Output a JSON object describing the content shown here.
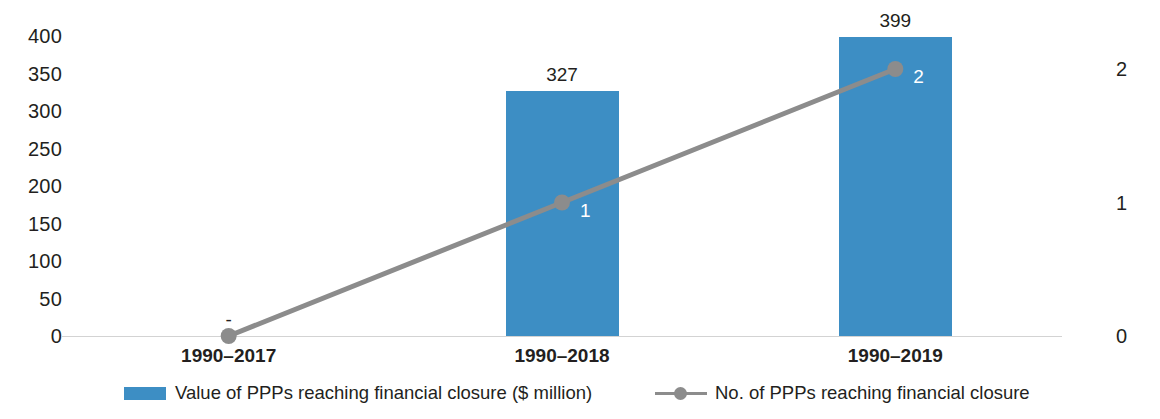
{
  "chart_data": {
    "type": "bar",
    "title": "",
    "subtitle": "",
    "xlabel": "",
    "ylabel": "",
    "categories": [
      "1990–2017",
      "1990–2018",
      "1990–2019"
    ],
    "left_axis": {
      "ticks": [
        "400",
        "350",
        "300",
        "250",
        "200",
        "150",
        "100",
        "50",
        "0"
      ],
      "ylim": [
        0,
        400
      ],
      "title": ""
    },
    "right_axis": {
      "ticks": [
        "2",
        "1",
        "0"
      ],
      "ylim": [
        0,
        2
      ],
      "title": ""
    },
    "grid": false,
    "legend_position": "bottom",
    "series": [
      {
        "name": "Value of PPPs reaching financial closure ($ million)",
        "type": "bar",
        "axis": "left",
        "color": "#3d8ec4",
        "values": [
          0,
          327,
          399
        ],
        "labels": [
          "-",
          "327",
          "399"
        ]
      },
      {
        "name": "No. of PPPs reaching financial closure",
        "type": "line",
        "axis": "right",
        "color": "#8c8c8c",
        "values": [
          0,
          1,
          2
        ],
        "labels": [
          "",
          "1",
          "2"
        ]
      }
    ]
  },
  "legend": {
    "items": [
      {
        "label": "Value of PPPs reaching financial closure ($ million)",
        "marker": "bar-swatch",
        "color": "#3d8ec4"
      },
      {
        "label": "No. of PPPs reaching financial closure",
        "marker": "line-marker-swatch",
        "color": "#8c8c8c"
      }
    ]
  }
}
